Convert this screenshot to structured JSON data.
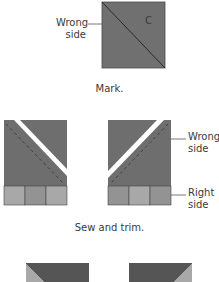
{
  "step1": {
    "label_wrong_side_line1": "Wrong",
    "label_wrong_side_line2": "side",
    "square_letter": "C",
    "caption": "Mark."
  },
  "step2": {
    "label_wrong_side_line1": "Wrong",
    "label_wrong_side_line2": "side",
    "label_right_side_line1": "Right",
    "label_right_side_line2": "side",
    "caption": "Sew and trim."
  },
  "colors": {
    "dark_fabric": "#6e6e6e",
    "darker_fabric": "#555555",
    "light_strip": "#a8a8a8",
    "mid_strip": "#8f8f8f",
    "seam_line": "#3a3a3a",
    "cut_gap": "#ffffff"
  }
}
